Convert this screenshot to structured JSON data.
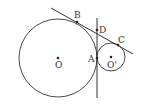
{
  "diagram": {
    "type": "geometry",
    "circles": [
      {
        "name": "O",
        "cx": 58,
        "cy": 58,
        "r": 39
      },
      {
        "name": "O'",
        "cx": 111,
        "cy": 57,
        "r": 14
      }
    ],
    "lines": [
      {
        "name": "external-tangent-BC",
        "x1": 51,
        "y1": 8,
        "x2": 133,
        "y2": 54
      },
      {
        "name": "internal-tangent-AD",
        "x1": 97,
        "y1": 18,
        "x2": 97,
        "y2": 98
      }
    ],
    "points": [
      {
        "label": "B",
        "x": 77,
        "y": 22,
        "lx": 74,
        "ly": 18
      },
      {
        "label": "D",
        "x": 97,
        "y": 30,
        "lx": 99,
        "ly": 33
      },
      {
        "label": "C",
        "x": 118,
        "y": 45,
        "lx": 118,
        "ly": 43
      },
      {
        "label": "A",
        "x": 97,
        "y": 58,
        "lx": 88,
        "ly": 62
      },
      {
        "label": "O",
        "x": 58,
        "y": 58,
        "lx": 55,
        "ly": 68
      },
      {
        "label": "O'",
        "x": 111,
        "y": 57,
        "lx": 107,
        "ly": 68
      }
    ],
    "stroke_color": "#333333"
  }
}
